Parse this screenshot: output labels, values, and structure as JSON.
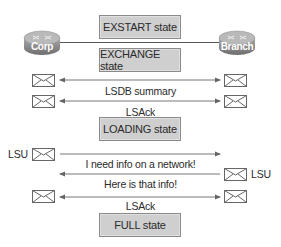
{
  "routers": {
    "left": {
      "label": "Corp"
    },
    "right": {
      "label": "Branch"
    }
  },
  "states": {
    "exstart": "EXSTART state",
    "exchange": "EXCHANGE state",
    "loading": "LOADING state",
    "full": "FULL state"
  },
  "messages": {
    "lsdb_summary": "LSDB summary",
    "lsack_1": "LSAck",
    "lsu_request": "I need info on a network!",
    "lsu_reply": "Here is that info!",
    "lsack_2": "LSAck"
  },
  "envelope_labels": {
    "lsu_left": "LSU",
    "lsu_right": "LSU"
  },
  "colors": {
    "state_box_fill": "#cfcfcf",
    "router_body": "#8c8c8c",
    "line": "#555555"
  }
}
